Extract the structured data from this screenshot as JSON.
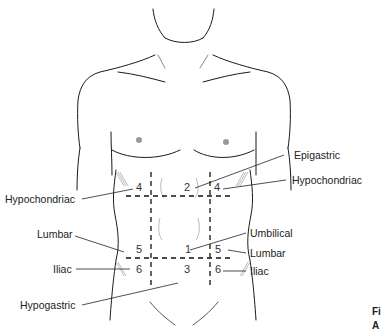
{
  "diagram": {
    "regions": [
      {
        "number": "1",
        "name": "Umbilical"
      },
      {
        "number": "2",
        "name": "Epigastric"
      },
      {
        "number": "3",
        "name": "Hypogastric"
      },
      {
        "number": "4",
        "name": "Hypochondriac"
      },
      {
        "number": "5",
        "name": "Lumbar"
      },
      {
        "number": "6",
        "name": "Iliac"
      }
    ],
    "labels": {
      "epigastric": "Epigastric",
      "hypochondriac_right": "Hypochondriac",
      "hypochondriac_left": "Hypochondriac",
      "lumbar_left": "Lumbar",
      "umbilical": "Umbilical",
      "lumbar_right": "Lumbar",
      "iliac_left": "Iliac",
      "iliac_right": "Iliac",
      "hypogastric": "Hypogastric"
    },
    "numbers": {
      "hypochondriac_left": "4",
      "epigastric": "2",
      "hypochondriac_right": "4",
      "lumbar_left": "5",
      "umbilical": "1",
      "lumbar_right": "5",
      "iliac_left": "6",
      "hypogastric": "3",
      "iliac_right": "6"
    },
    "caption_fragment": {
      "line1": "Fi",
      "line2": "A"
    }
  }
}
